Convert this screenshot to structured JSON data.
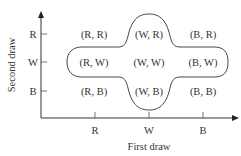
{
  "diagram": {
    "x_axis": {
      "label": "First draw",
      "ticks": [
        "R",
        "W",
        "B"
      ]
    },
    "y_axis": {
      "label": "Second draw",
      "ticks": [
        "R",
        "W",
        "B"
      ]
    },
    "cells": {
      "row_R": [
        "(R, R)",
        "(W, R)",
        "(B, R)"
      ],
      "row_W": [
        "(R, W)",
        "(W, W)",
        "(B, W)"
      ],
      "row_B": [
        "(R, B)",
        "(W, B)",
        "(B, B)"
      ]
    },
    "highlighted_region": {
      "description": "Outcomes containing at least one W",
      "members": [
        "(W, R)",
        "(R, W)",
        "(W, W)",
        "(B, W)",
        "(W, B)"
      ]
    },
    "colors": {
      "line": "#333333",
      "text": "#333333",
      "background": "#ffffff"
    }
  }
}
